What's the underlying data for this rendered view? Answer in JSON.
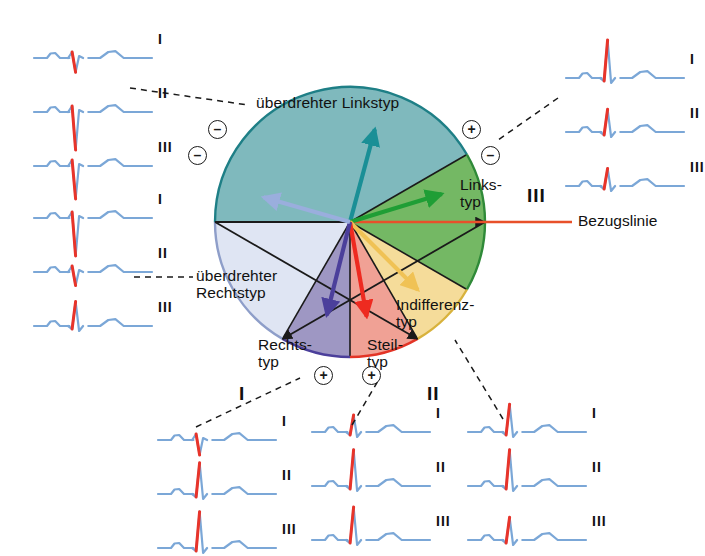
{
  "figure": {
    "type": "cabrera-circle-ecg-axis-diagram",
    "background": "#ffffff",
    "circle": {
      "cx": 350,
      "cy": 222,
      "r": 135,
      "stroke": "#1a1a1a"
    }
  },
  "labels": {
    "ueberdrehter_linkstyp": "überdrehter Linkstyp",
    "ueberdrehter_rechtstyp_line1": "überdrehter",
    "ueberdrehter_rechtstyp_line2": "Rechtstyp",
    "linkstyp_line1": "Links-",
    "linkstyp_line2": "typ",
    "indifferenztyp_line1": "Indifferenz-",
    "indifferenztyp_line2": "typ",
    "steiltyp_line1": "Steil-",
    "steiltyp_line2": "typ",
    "rechtstyp_line1": "Rechts-",
    "rechtstyp_line2": "typ",
    "bezugslinie": "Bezugslinie",
    "roman_I": "I",
    "roman_II": "II",
    "roman_III": "III"
  },
  "sectors": [
    {
      "name": "ueberdrehter-linkstyp",
      "label": "überdrehter Linkstyp",
      "color": "#7fb9bd",
      "start_deg": 180,
      "end_deg": 330,
      "arrow_color": "#1a8f96",
      "arrow_deg": 285
    },
    {
      "name": "linkstyp",
      "label": "Linkstyp",
      "color": "#74b864",
      "start_deg": 330,
      "end_deg": 30,
      "arrow_color": "#1f9e35",
      "arrow_deg": 343
    },
    {
      "name": "indifferenztyp",
      "label": "Indifferenztyp",
      "color": "#f5dc9a",
      "start_deg": 30,
      "end_deg": 60,
      "arrow_color": "#f0c255",
      "arrow_deg": 45
    },
    {
      "name": "steiltyp",
      "label": "Steiltyp",
      "color": "#f0a195",
      "start_deg": 60,
      "end_deg": 90,
      "arrow_color": "#ee2a20",
      "arrow_deg": 80
    },
    {
      "name": "rechtstyp",
      "label": "Rechtstyp",
      "color": "#9e97c3",
      "start_deg": 90,
      "end_deg": 120,
      "arrow_color": "#4b3f9b",
      "arrow_deg": 104
    },
    {
      "name": "ueberdrehter-rechtstyp",
      "label": "überdrehter Rechtstyp",
      "color": "#dfe5f3",
      "start_deg": 120,
      "end_deg": 180,
      "arrow_color": "#9aaedd",
      "arrow_deg": 196
    }
  ],
  "reference_line": {
    "name": "bezugslinie",
    "color": "#e8502a",
    "label": "Bezugslinie"
  },
  "polarity_markers": [
    {
      "name": "minus-top-left",
      "sign": "–",
      "x": 208,
      "y": 120
    },
    {
      "name": "minus-mid-left",
      "sign": "–",
      "x": 188,
      "y": 146
    },
    {
      "name": "plus-top-right",
      "sign": "+",
      "x": 462,
      "y": 120
    },
    {
      "name": "minus-mid-right",
      "sign": "–",
      "x": 481,
      "y": 146
    },
    {
      "name": "plus-bottom-left",
      "sign": "+",
      "x": 314,
      "y": 366
    },
    {
      "name": "plus-bottom-right",
      "sign": "+",
      "x": 362,
      "y": 366
    }
  ],
  "ecg_groups": [
    {
      "name": "ecg-ueberdrehter-linkstyp",
      "position": "top-left",
      "x": 34,
      "y": 36,
      "label_side": "right",
      "traces": [
        {
          "lead": "I",
          "pattern": "small-negative",
          "r_amp": -0.3,
          "s_amp": 0.0
        },
        {
          "lead": "II",
          "pattern": "deep-negative",
          "r_amp": -1.0,
          "s_amp": 0.0
        },
        {
          "lead": "III",
          "pattern": "deep-negative",
          "r_amp": -0.85,
          "s_amp": 0.0
        }
      ]
    },
    {
      "name": "ecg-ueberdrehter-rechtstyp",
      "position": "mid-left",
      "x": 34,
      "y": 196,
      "label_side": "right",
      "traces": [
        {
          "lead": "I",
          "pattern": "deep-negative",
          "r_amp": -1.0,
          "s_amp": 0.0
        },
        {
          "lead": "II",
          "pattern": "small-negative",
          "r_amp": -0.28,
          "s_amp": 0.0
        },
        {
          "lead": "III",
          "pattern": "moderate-positive",
          "r_amp": 0.6,
          "s_amp": 0.0
        }
      ]
    },
    {
      "name": "ecg-linkstyp",
      "position": "top-right",
      "x": 566,
      "y": 56,
      "label_side": "right",
      "traces": [
        {
          "lead": "I",
          "pattern": "tall-positive",
          "r_amp": 1.0,
          "s_amp": 0.0
        },
        {
          "lead": "II",
          "pattern": "moderate-positive",
          "r_amp": 0.55,
          "s_amp": 0.0
        },
        {
          "lead": "III",
          "pattern": "small-positive",
          "r_amp": 0.4,
          "s_amp": 0.0
        }
      ]
    },
    {
      "name": "ecg-rechtstyp",
      "position": "bottom-left",
      "x": 158,
      "y": 418,
      "label_side": "right",
      "traces": [
        {
          "lead": "I",
          "pattern": "small-negative",
          "r_amp": -0.32,
          "s_amp": 0.0
        },
        {
          "lead": "II",
          "pattern": "tall-positive",
          "r_amp": 0.8,
          "s_amp": 0.0
        },
        {
          "lead": "III",
          "pattern": "tall-positive",
          "r_amp": 0.95,
          "s_amp": 0.0
        }
      ]
    },
    {
      "name": "ecg-steiltyp",
      "position": "bottom-center",
      "x": 312,
      "y": 410,
      "label_side": "right",
      "traces": [
        {
          "lead": "I",
          "pattern": "small-positive",
          "r_amp": 0.38,
          "s_amp": 0.0
        },
        {
          "lead": "II",
          "pattern": "tall-positive",
          "r_amp": 0.95,
          "s_amp": 0.0
        },
        {
          "lead": "III",
          "pattern": "tall-positive",
          "r_amp": 0.85,
          "s_amp": 0.0
        }
      ]
    },
    {
      "name": "ecg-indifferenztyp",
      "position": "bottom-right",
      "x": 468,
      "y": 410,
      "label_side": "right",
      "traces": [
        {
          "lead": "I",
          "pattern": "moderate-positive",
          "r_amp": 0.7,
          "s_amp": 0.0
        },
        {
          "lead": "II",
          "pattern": "tall-positive",
          "r_amp": 0.95,
          "s_amp": 0.0
        },
        {
          "lead": "III",
          "pattern": "moderate-positive",
          "r_amp": 0.55,
          "s_amp": 0.0
        }
      ]
    }
  ],
  "outer_romans": [
    {
      "name": "roman-bottom-left",
      "text": "I",
      "x": 239,
      "y": 384
    },
    {
      "name": "roman-bottom-right",
      "text": "II",
      "x": 427,
      "y": 384
    },
    {
      "name": "roman-right",
      "text": "III",
      "x": 527,
      "y": 186
    }
  ],
  "trace_style": {
    "baseline_color": "#7ba7d7",
    "qrs_color": "#e8342a"
  }
}
